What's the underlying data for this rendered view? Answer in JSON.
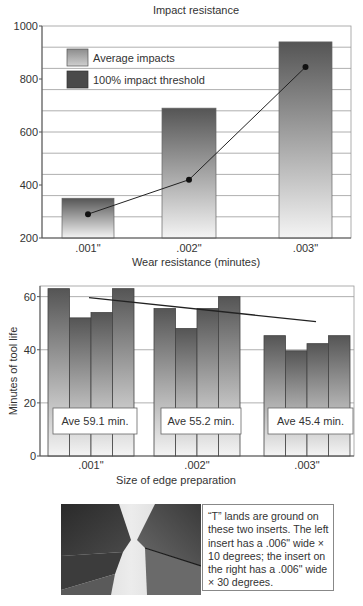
{
  "chart_data": [
    {
      "type": "bar",
      "title": "Impact resistance",
      "xlabel": "Wear resistance (minutes)",
      "ylabel": "",
      "ylim": [
        200,
        1000
      ],
      "yticks": [
        200,
        400,
        600,
        800,
        1000
      ],
      "grid": true,
      "legend_position": "upper-left-inside",
      "categories": [
        ".001\"",
        ".002\"",
        ".003\""
      ],
      "series": [
        {
          "name": "Average impacts",
          "type": "bar",
          "values": [
            350,
            690,
            940
          ]
        },
        {
          "name": "100% impact threshold",
          "type": "line",
          "values": [
            290,
            420,
            845
          ]
        }
      ]
    },
    {
      "type": "bar",
      "title": "",
      "xlabel": "Size of edge preparation",
      "ylabel": "Minutes of tool life",
      "ylim": [
        0,
        64
      ],
      "yticks": [
        0,
        20,
        40,
        60
      ],
      "grid": true,
      "categories": [
        ".001\"",
        ".002\"",
        ".003\""
      ],
      "groups": [
        {
          "category": ".001\"",
          "values": [
            63,
            52,
            54,
            63
          ],
          "annotation": "Ave 59.1 min."
        },
        {
          "category": ".002\"",
          "values": [
            55.5,
            48,
            55.5,
            60
          ],
          "annotation": "Ave 55.2 min."
        },
        {
          "category": ".003\"",
          "values": [
            45.3,
            39.6,
            42.3,
            45.3
          ],
          "annotation": "Ave 45.4 min."
        }
      ],
      "trend_line": {
        "from": 59.6,
        "to": 50.6
      }
    }
  ],
  "photo": {
    "caption": "“T” lands are ground on these two inserts. The left insert has a .006\" wide × 10 degrees; the insert on the right has a .006\" wide × 30 degrees."
  },
  "colors": {
    "bar_top": "#555555",
    "bar_bottom": "#f4f4f4",
    "legend_avg": "#b0b0b0",
    "legend_threshold": "#4a4a4a",
    "grid": "#9a9a9a",
    "axis": "#555555",
    "line": "#222222"
  }
}
